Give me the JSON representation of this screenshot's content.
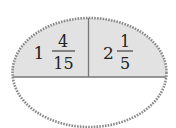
{
  "diagram": {
    "type": "set-ellipse",
    "colors": {
      "shaded_fill": "#e2e2e2",
      "outline": "#8a8a8a",
      "divider": "#777777",
      "text": "#222222"
    },
    "cells": [
      {
        "whole": "1",
        "numerator": "4",
        "denominator": "15"
      },
      {
        "whole": "2",
        "numerator": "1",
        "denominator": "5"
      }
    ],
    "bottom_region": {
      "content": ""
    }
  }
}
